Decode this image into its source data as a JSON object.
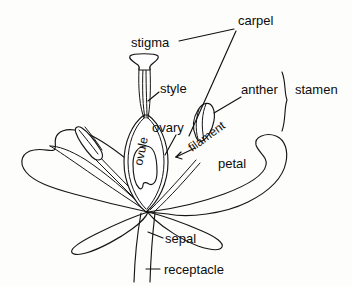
{
  "diagram": {
    "background_color": "#fdfdfb",
    "line_color": "#161616",
    "labels": {
      "carpel": "carpel",
      "stigma": "stigma",
      "style": "style",
      "ovary": "ovary",
      "ovule": "ovule",
      "anther": "anther",
      "stamen": "stamen",
      "filament": "filament",
      "petal": "petal",
      "sepal": "sepal",
      "receptacle": "receptacle"
    },
    "parts": [
      {
        "name": "stigma",
        "label": "stigma",
        "group": "carpel"
      },
      {
        "name": "style",
        "label": "style",
        "group": "carpel"
      },
      {
        "name": "ovary",
        "label": "ovary",
        "group": "carpel"
      },
      {
        "name": "ovule",
        "label": "ovule",
        "group": "carpel"
      },
      {
        "name": "anther",
        "label": "anther",
        "group": "stamen"
      },
      {
        "name": "filament",
        "label": "filament",
        "group": "stamen"
      },
      {
        "name": "petal",
        "label": "petal",
        "group": "perianth"
      },
      {
        "name": "sepal",
        "label": "sepal",
        "group": "perianth"
      },
      {
        "name": "receptacle",
        "label": "receptacle",
        "group": "axis"
      }
    ],
    "groups": [
      {
        "name": "carpel",
        "label": "carpel",
        "members": [
          "stigma",
          "style",
          "ovary",
          "ovule"
        ]
      },
      {
        "name": "stamen",
        "label": "stamen",
        "members": [
          "anther",
          "filament"
        ]
      }
    ]
  }
}
